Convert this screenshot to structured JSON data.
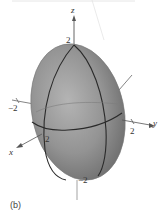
{
  "figure": {
    "caption": "(b)",
    "shape": "ellipsoid",
    "colors": {
      "surface": "#8e8e8e",
      "surface_light": "#b4b4b4",
      "surface_dark": "#6a6a6a",
      "trace_lines": "#2a2a2a",
      "axes": "#555555"
    },
    "axes": {
      "z": {
        "label": "z",
        "top_tick": "2",
        "bottom_tick": "−2"
      },
      "y": {
        "label": "y",
        "pos_tick": "2",
        "neg_tick": "−2"
      },
      "x": {
        "label": "x",
        "pos_tick": "2"
      }
    }
  }
}
